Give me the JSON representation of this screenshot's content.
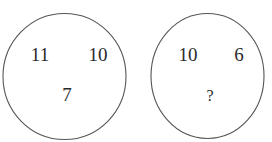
{
  "puzzle": {
    "circles": [
      {
        "top_left": "11",
        "top_right": "10",
        "bottom": "7"
      },
      {
        "top_left": "10",
        "top_right": "6",
        "bottom": "?"
      }
    ]
  },
  "colors": {
    "stroke": "#555555",
    "text": "#2a2a2a",
    "background": "#ffffff"
  }
}
